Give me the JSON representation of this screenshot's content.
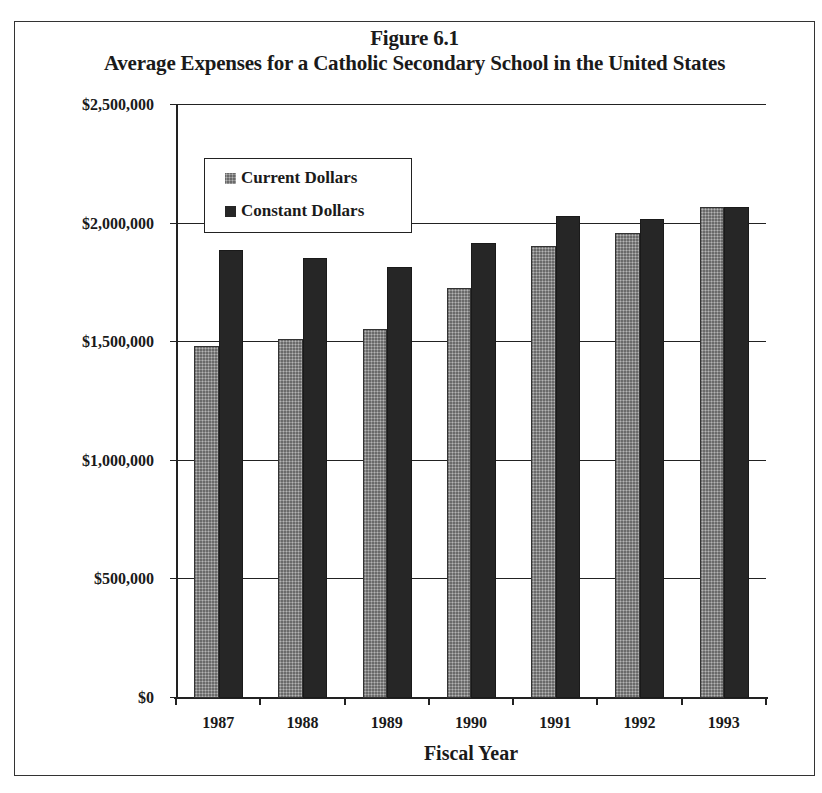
{
  "figure": {
    "label": "Figure 6.1",
    "title": "Average Expenses for a Catholic Secondary School in the United States"
  },
  "colors": {
    "current": "#6a6a6a",
    "constant": "#262626",
    "axis": "#222222"
  },
  "axes": {
    "xlabel": "Fiscal Year",
    "yticks": [
      "$0",
      "$500,000",
      "$1,000,000",
      "$1,500,000",
      "$2,000,000",
      "$2,500,000"
    ]
  },
  "legend": {
    "items": [
      {
        "label": "Current Dollars",
        "series": "current"
      },
      {
        "label": "Constant Dollars",
        "series": "constant"
      }
    ]
  },
  "chart_data": {
    "type": "bar",
    "xlabel": "Fiscal Year",
    "ylabel": "",
    "categories": [
      "1987",
      "1988",
      "1989",
      "1990",
      "1991",
      "1992",
      "1993"
    ],
    "series": [
      {
        "name": "Current Dollars",
        "values": [
          1485000,
          1515000,
          1555000,
          1730000,
          1905000,
          1960000,
          2070000
        ]
      },
      {
        "name": "Constant Dollars",
        "values": [
          1890000,
          1855000,
          1815000,
          1920000,
          2030000,
          2020000,
          2070000
        ]
      }
    ],
    "ylim": [
      0,
      2500000
    ],
    "yticks": [
      0,
      500000,
      1000000,
      1500000,
      2000000,
      2500000
    ],
    "grid": "horizontal",
    "legend_position": "upper-left inside plot"
  }
}
